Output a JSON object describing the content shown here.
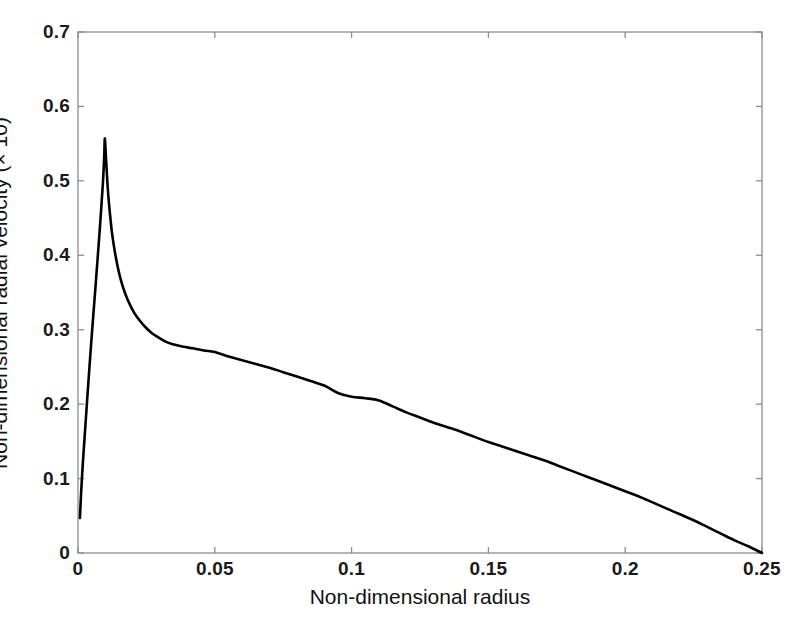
{
  "figure": {
    "background_color": "#ffffff",
    "frame_color": "#8c8c8c",
    "curve_color": "#000000"
  },
  "axes": {
    "x_title": "Non-dimensional radius",
    "y_title": "Non-dimensional radial velocity (× 10)",
    "x_ticks": [
      "0",
      "0.05",
      "0.1",
      "0.15",
      "0.2",
      "0.25"
    ],
    "x_tick_values": [
      0,
      0.05,
      0.1,
      0.15,
      0.2,
      0.25
    ],
    "y_ticks": [
      "0",
      "0.1",
      "0.2",
      "0.3",
      "0.4",
      "0.5",
      "0.6",
      "0.7"
    ],
    "y_tick_values": [
      0,
      0.1,
      0.2,
      0.3,
      0.4,
      0.5,
      0.6,
      0.7
    ]
  },
  "chart_data": {
    "type": "line",
    "title": "",
    "xlabel": "Non-dimensional radius",
    "ylabel": "Non-dimensional radial velocity (× 10)",
    "xlim": [
      0,
      0.25
    ],
    "ylim": [
      0,
      0.7
    ],
    "grid": false,
    "legend": null,
    "series": [
      {
        "name": "radial velocity",
        "color": "#000000",
        "line_width": 2.6,
        "x": [
          0.0007,
          0.0012,
          0.0018,
          0.0025,
          0.0032,
          0.004,
          0.0048,
          0.0056,
          0.0064,
          0.0072,
          0.0079,
          0.0086,
          0.0091,
          0.0094,
          0.0096,
          0.0098,
          0.0101,
          0.0105,
          0.011,
          0.0117,
          0.0125,
          0.0135,
          0.0146,
          0.0158,
          0.0172,
          0.0188,
          0.0205,
          0.0224,
          0.0245,
          0.0268,
          0.0292,
          0.032,
          0.035,
          0.0385,
          0.042,
          0.046,
          0.05,
          0.055,
          0.06,
          0.065,
          0.07,
          0.075,
          0.08,
          0.085,
          0.09,
          0.095,
          0.1,
          0.105,
          0.11,
          0.115,
          0.12,
          0.125,
          0.13,
          0.135,
          0.14,
          0.145,
          0.15,
          0.155,
          0.16,
          0.165,
          0.17,
          0.175,
          0.18,
          0.185,
          0.19,
          0.195,
          0.2,
          0.205,
          0.21,
          0.215,
          0.22,
          0.225,
          0.23,
          0.235,
          0.24,
          0.245,
          0.25
        ],
        "y": [
          0.047,
          0.085,
          0.122,
          0.16,
          0.198,
          0.24,
          0.281,
          0.32,
          0.358,
          0.397,
          0.432,
          0.469,
          0.497,
          0.518,
          0.536,
          0.557,
          0.54,
          0.513,
          0.484,
          0.455,
          0.428,
          0.404,
          0.383,
          0.365,
          0.349,
          0.335,
          0.323,
          0.313,
          0.304,
          0.296,
          0.29,
          0.284,
          0.28,
          0.277,
          0.275,
          0.272,
          0.27,
          0.264,
          0.259,
          0.254,
          0.249,
          0.243,
          0.237,
          0.231,
          0.225,
          0.215,
          0.21,
          0.208,
          0.205,
          0.197,
          0.189,
          0.182,
          0.175,
          0.169,
          0.163,
          0.156,
          0.149,
          0.143,
          0.137,
          0.131,
          0.125,
          0.118,
          0.111,
          0.104,
          0.097,
          0.09,
          0.083,
          0.076,
          0.068,
          0.06,
          0.052,
          0.044,
          0.035,
          0.026,
          0.017,
          0.009,
          0.0
        ]
      }
    ],
    "annotations": [
      {
        "text": "peak",
        "x": 0.0098,
        "y": 0.557
      },
      {
        "text": "plateau",
        "x": 0.045,
        "y": 0.272
      },
      {
        "text": "zero crossing",
        "x": 0.25,
        "y": 0.0
      }
    ]
  }
}
